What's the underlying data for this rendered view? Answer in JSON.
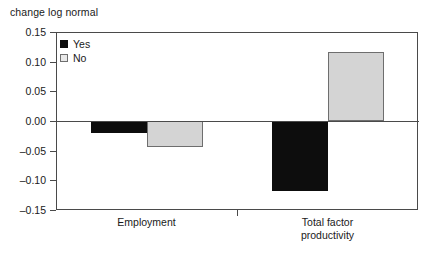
{
  "chart_data": {
    "type": "bar",
    "title": "",
    "ylabel": "change log normal",
    "xlabel": "",
    "categories": [
      "Employment",
      "Total factor productivity"
    ],
    "category_labels": [
      [
        "Employment"
      ],
      [
        "Total factor",
        "productivity"
      ]
    ],
    "series": [
      {
        "name": "Yes",
        "color": "#0d0d0d",
        "values": [
          -0.021,
          -0.118
        ]
      },
      {
        "name": "No",
        "color": "#d4d4d4",
        "values": [
          -0.044,
          0.116
        ]
      }
    ],
    "ylim": [
      -0.15,
      0.15
    ],
    "yticks": [
      0.15,
      0.1,
      0.05,
      0.0,
      -0.05,
      -0.1,
      -0.15
    ],
    "ytick_labels": [
      "0.15",
      "0.10",
      "0.05",
      "0.00",
      "-0.05",
      "-0.10",
      "-0.15"
    ],
    "grid": false,
    "legend_position": "top-left",
    "legend_entries": [
      "Yes",
      "No"
    ]
  }
}
